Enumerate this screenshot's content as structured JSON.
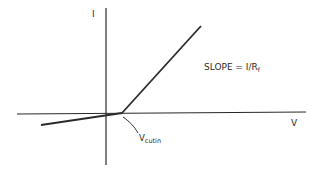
{
  "diagram": {
    "type": "piecewise-linear I-V characteristic",
    "axes": {
      "y_label": "I",
      "x_label": "V"
    },
    "annotations": {
      "slope_text": "SLOPE = I/R",
      "slope_subscript": "f",
      "knee_main": "V",
      "knee_subscript": "cutin"
    },
    "colors": {
      "ink": "#2a2a2a",
      "background": "#ffffff"
    }
  }
}
